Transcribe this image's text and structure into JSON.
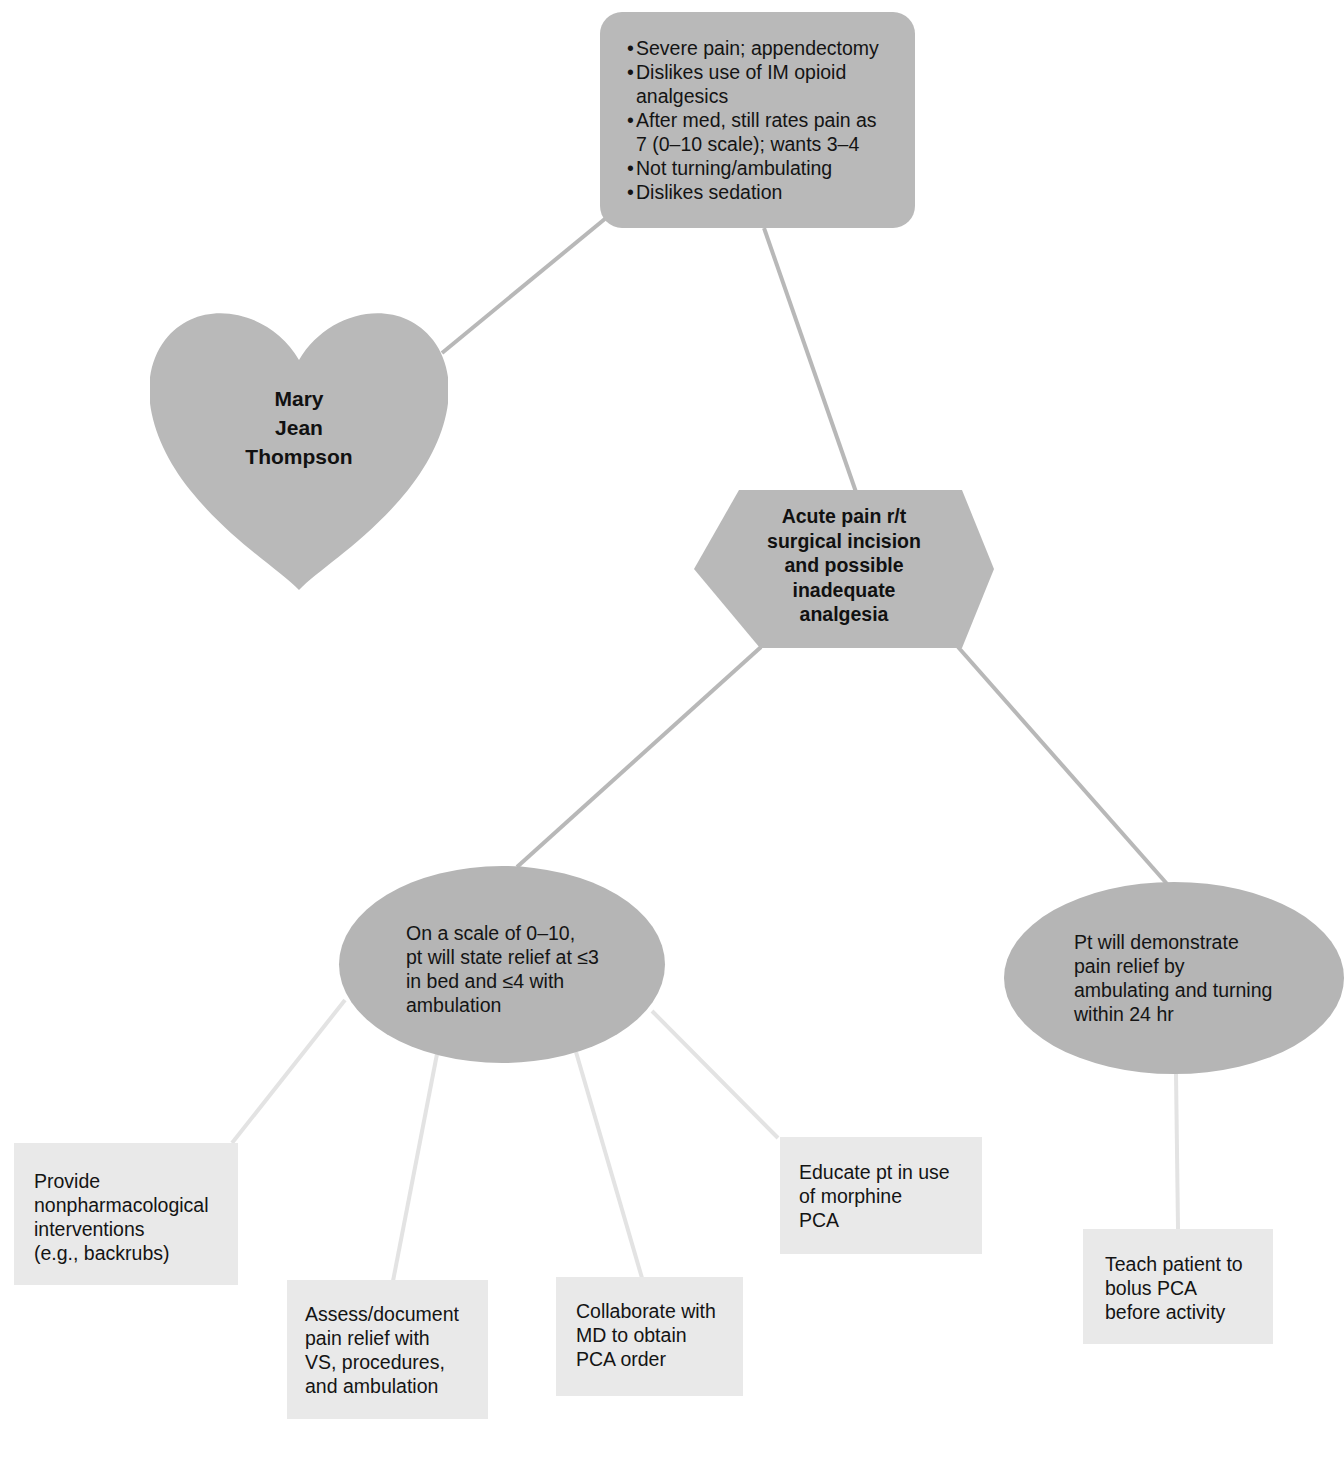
{
  "diagram": {
    "type": "nursing care concept map",
    "colors": {
      "node_fill_dark": "#b9b9b9",
      "node_fill_light": "#e9e9e9",
      "connector_dark": "#b8b8b8",
      "connector_light": "#e3e3e3",
      "text": "#141414"
    },
    "assessment": {
      "items": [
        {
          "bullet": "•",
          "lines": [
            "Severe pain; appendectomy"
          ]
        },
        {
          "bullet": "•",
          "lines": [
            "Dislikes use of IM opioid",
            "analgesics"
          ]
        },
        {
          "bullet": "•",
          "lines": [
            "After med, still rates pain as",
            "7 (0–10 scale); wants 3–4"
          ]
        },
        {
          "bullet": "•",
          "lines": [
            "Not turning/ambulating"
          ]
        },
        {
          "bullet": "•",
          "lines": [
            "Dislikes sedation"
          ]
        }
      ]
    },
    "patient": {
      "lines": [
        "Mary",
        "Jean",
        "Thompson"
      ]
    },
    "diagnosis": {
      "lines": [
        "Acute pain r/t",
        "surgical incision",
        "and possible",
        "inadequate",
        "analgesia"
      ]
    },
    "goals": [
      {
        "lines": [
          "On a scale of 0–10,",
          "pt will state relief at ≤3",
          "in bed and ≤4 with",
          "ambulation"
        ]
      },
      {
        "lines": [
          "Pt will demonstrate",
          "pain relief by",
          "ambulating and turning",
          "within 24 hr"
        ]
      }
    ],
    "interventions": [
      {
        "lines": [
          "Provide",
          "nonpharmacological",
          "interventions",
          "(e.g., backrubs)"
        ]
      },
      {
        "lines": [
          "Assess/document",
          "pain relief with",
          "VS, procedures,",
          "and ambulation"
        ]
      },
      {
        "lines": [
          "Collaborate with",
          "MD to obtain",
          "PCA order"
        ]
      },
      {
        "lines": [
          "Educate pt in use",
          "of morphine",
          "PCA"
        ]
      },
      {
        "lines": [
          "Teach patient to",
          "bolus PCA",
          "before activity"
        ]
      }
    ],
    "connections": [
      {
        "from": "assessment",
        "to": "patient"
      },
      {
        "from": "assessment",
        "to": "diagnosis"
      },
      {
        "from": "diagnosis",
        "to": "goal-1"
      },
      {
        "from": "diagnosis",
        "to": "goal-2"
      },
      {
        "from": "goal-1",
        "to": "intervention-1"
      },
      {
        "from": "goal-1",
        "to": "intervention-2"
      },
      {
        "from": "goal-1",
        "to": "intervention-3"
      },
      {
        "from": "goal-1",
        "to": "intervention-4"
      },
      {
        "from": "goal-2",
        "to": "intervention-5"
      }
    ]
  }
}
